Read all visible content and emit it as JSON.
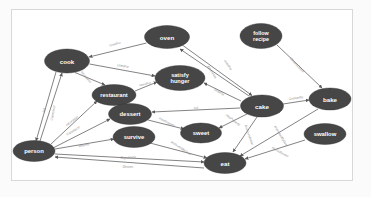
{
  "figure": {
    "kind": "knowledge-graph",
    "title": "",
    "background_color": "#ffffff",
    "border_color": "#d8d8d8",
    "node_fill": "#464646",
    "node_text_color": "#ffffff",
    "edge_color": "#5a5a5a",
    "edge_label_color": "#8a8a8a"
  },
  "nodes": [
    {
      "id": "oven",
      "label": "oven",
      "cx": 167,
      "cy": 37,
      "rx": 22.5,
      "ry": 11.5,
      "font": 6.2,
      "lines": [
        "oven"
      ]
    },
    {
      "id": "follow_recipe",
      "label": "follow recipe",
      "cx": 261,
      "cy": 36,
      "rx": 21,
      "ry": 12.5,
      "font": 5.4,
      "lines": [
        "follow",
        "recipe"
      ]
    },
    {
      "id": "cook",
      "label": "cook",
      "cx": 67,
      "cy": 61,
      "rx": 22.5,
      "ry": 12,
      "font": 6.2,
      "lines": [
        "cook"
      ]
    },
    {
      "id": "satisfy_hunger",
      "label": "satisfy hunger",
      "cx": 180,
      "cy": 78,
      "rx": 25,
      "ry": 12.5,
      "font": 5.6,
      "lines": [
        "satisfy",
        "hunger"
      ]
    },
    {
      "id": "restaurant",
      "label": "restaurant",
      "cx": 114,
      "cy": 95,
      "rx": 22,
      "ry": 10.5,
      "font": 5.6,
      "lines": [
        "restaurant"
      ]
    },
    {
      "id": "cake",
      "label": "cake",
      "cx": 262,
      "cy": 106,
      "rx": 21.5,
      "ry": 11,
      "font": 6.2,
      "lines": [
        "cake"
      ]
    },
    {
      "id": "bake",
      "label": "bake",
      "cx": 330,
      "cy": 99,
      "rx": 21,
      "ry": 11,
      "font": 6.2,
      "lines": [
        "bake"
      ]
    },
    {
      "id": "dessert",
      "label": "dessert",
      "cx": 130,
      "cy": 114,
      "rx": 21.5,
      "ry": 10.5,
      "font": 5.9,
      "lines": [
        "dessert"
      ]
    },
    {
      "id": "sweet",
      "label": "sweet",
      "cx": 201,
      "cy": 133,
      "rx": 20.5,
      "ry": 10,
      "font": 5.9,
      "lines": [
        "sweet"
      ]
    },
    {
      "id": "swallow",
      "label": "swallow",
      "cx": 325,
      "cy": 134,
      "rx": 21,
      "ry": 10.5,
      "font": 5.9,
      "lines": [
        "swallow"
      ]
    },
    {
      "id": "survive",
      "label": "survive",
      "cx": 134,
      "cy": 137,
      "rx": 21,
      "ry": 10.5,
      "font": 5.9,
      "lines": [
        "survive"
      ]
    },
    {
      "id": "person",
      "label": "person",
      "cx": 34,
      "cy": 151,
      "rx": 21,
      "ry": 10.5,
      "font": 5.9,
      "lines": [
        "person"
      ]
    },
    {
      "id": "eat",
      "label": "eat",
      "cx": 225,
      "cy": 163,
      "rx": 21,
      "ry": 10.5,
      "font": 6.2,
      "lines": [
        "eat"
      ]
    }
  ],
  "edges": [
    {
      "id": "oven-cook",
      "source": "oven",
      "target": "cook",
      "label": "UsedFor",
      "lx": 115,
      "ly": 44,
      "angle": -14
    },
    {
      "id": "cook-satisfy",
      "source": "cook",
      "target": "satisfy_hunger",
      "label": "UsedFor",
      "lx": 123,
      "ly": 66,
      "angle": 10
    },
    {
      "id": "cook-restaurant",
      "source": "cook",
      "target": "restaurant",
      "label": "AtLocation",
      "lx": 86,
      "ly": 77,
      "angle": 50
    },
    {
      "id": "restaurant-satisfy",
      "source": "restaurant",
      "target": "satisfy_hunger",
      "label": "UsedFor",
      "lx": 145,
      "ly": 84,
      "angle": -12
    },
    {
      "id": "oven-cake",
      "source": "oven",
      "target": "cake",
      "label": "UsedFor",
      "lx": 228,
      "ly": 65,
      "angle": 55
    },
    {
      "id": "cake-oven",
      "source": "cake",
      "target": "oven",
      "label": "AtLocation",
      "lx": 212,
      "ly": 72,
      "angle": 58
    },
    {
      "id": "cake-satisfy",
      "source": "cake",
      "target": "satisfy_hunger",
      "label": "UsedFor",
      "lx": 219,
      "ly": 92,
      "angle": 32
    },
    {
      "id": "follow-bake",
      "source": "follow_recipe",
      "target": "bake",
      "label": "CausesDesire",
      "lx": 297,
      "ly": 65,
      "angle": 48
    },
    {
      "id": "cake-bake",
      "source": "cake",
      "target": "bake",
      "label": "CreatedBy",
      "lx": 296,
      "ly": 98,
      "angle": -8
    },
    {
      "id": "cake-dessert",
      "source": "cake",
      "target": "dessert",
      "label": "IsA",
      "lx": 196,
      "ly": 108,
      "angle": -2
    },
    {
      "id": "dessert-sweet",
      "source": "dessert",
      "target": "sweet",
      "label": "HasProperty",
      "lx": 167,
      "ly": 122,
      "angle": 26
    },
    {
      "id": "cake-sweet",
      "source": "cake",
      "target": "sweet",
      "label": "HasProperty",
      "lx": 233,
      "ly": 120,
      "angle": 38
    },
    {
      "id": "cake-eat",
      "source": "cake",
      "target": "eat",
      "label": "ReceivesAction",
      "lx": 249,
      "ly": 135,
      "angle": 70
    },
    {
      "id": "bake-eat",
      "source": "bake",
      "target": "eat",
      "label": "MotivatedByGoal",
      "lx": 281,
      "ly": 136,
      "angle": 59
    },
    {
      "id": "swallow-eat",
      "source": "swallow",
      "target": "eat",
      "label": "HasSubevent",
      "lx": 280,
      "ly": 152,
      "angle": 29
    },
    {
      "id": "person-cook",
      "source": "person",
      "target": "cook",
      "label": "IsA",
      "lx": 44,
      "ly": 110,
      "angle": -78
    },
    {
      "id": "cook-person",
      "source": "cook",
      "target": "person",
      "label": "CapableOf",
      "lx": 53,
      "ly": 113,
      "angle": -78
    },
    {
      "id": "person-restaurant",
      "source": "person",
      "target": "restaurant",
      "label": "AtLocation",
      "lx": 72,
      "ly": 121,
      "angle": -37
    },
    {
      "id": "person-dessert",
      "source": "person",
      "target": "dessert",
      "label": "CapableOf",
      "lx": 73,
      "ly": 131,
      "angle": -30
    },
    {
      "id": "person-survive",
      "source": "person",
      "target": "survive",
      "label": "Desires",
      "lx": 84,
      "ly": 145,
      "angle": -13
    },
    {
      "id": "survive-eat",
      "source": "survive",
      "target": "eat",
      "label": "MotivatedByGoal",
      "lx": 181,
      "ly": 148,
      "angle": 33
    },
    {
      "id": "person-eat-capableof",
      "source": "person",
      "target": "eat",
      "label": "CapableOf",
      "lx": 128,
      "ly": 158,
      "angle": 0
    },
    {
      "id": "person-eat-desires",
      "source": "person",
      "target": "eat",
      "label": "Desires",
      "lx": 128,
      "ly": 167,
      "angle": 0
    }
  ],
  "edge_geometry": [
    {
      "id": "oven-cook",
      "path": "M 146.5,43 L 89,57",
      "arrow_at": "end"
    },
    {
      "id": "cook-satisfy",
      "path": "M 89.5,64 L 155,76",
      "arrow_at": "end"
    },
    {
      "id": "cook-restaurant",
      "path": "M 75,72.5 L 105,85",
      "arrow_at": "end"
    },
    {
      "id": "restaurant-satisfy",
      "path": "M 135,91 L 157,82",
      "arrow_at": "end"
    },
    {
      "id": "oven-cake",
      "path": "M 183,45.5 L 252,95.5",
      "arrow_at": "end"
    },
    {
      "id": "cake-oven",
      "path": "M 249,96 L 180,49",
      "arrow_at": "end"
    },
    {
      "id": "cake-satisfy",
      "path": "M 241,101 L 204,83",
      "arrow_at": "end"
    },
    {
      "id": "follow-bake",
      "path": "M 277,45 L 322,88",
      "arrow_at": "end"
    },
    {
      "id": "cake-bake",
      "path": "M 283,104 L 309,100",
      "arrow_at": "end"
    },
    {
      "id": "cake-dessert",
      "path": "M 240,108 L 152,112",
      "arrow_at": "end"
    },
    {
      "id": "dessert-sweet",
      "path": "M 148,120 L 184,129",
      "arrow_at": "end"
    },
    {
      "id": "cake-sweet",
      "path": "M 247,114 L 219,128",
      "arrow_at": "end"
    },
    {
      "id": "cake-eat",
      "path": "M 257,117 L 233,152",
      "arrow_at": "end"
    },
    {
      "id": "bake-eat",
      "path": "M 318,109 L 240,156",
      "arrow_at": "end"
    },
    {
      "id": "swallow-eat",
      "path": "M 305,140 L 245,159",
      "arrow_at": "end"
    },
    {
      "id": "person-cook",
      "path": "M 40,141 L 62,73",
      "arrow_at": "end"
    },
    {
      "id": "cook-person",
      "path": "M 56,72 L 36,141",
      "arrow_at": "end"
    },
    {
      "id": "person-restaurant",
      "path": "M 51,144 L 97,101",
      "arrow_at": "end"
    },
    {
      "id": "person-dessert",
      "path": "M 53,148 L 110,119",
      "arrow_at": "end"
    },
    {
      "id": "person-survive",
      "path": "M 55,149 L 114,139",
      "arrow_at": "end"
    },
    {
      "id": "survive-eat",
      "path": "M 150,143 L 207,158",
      "arrow_at": "end"
    },
    {
      "id": "person-eat-capableof",
      "path": "M 55,154 L 204,162",
      "arrow_at": "end"
    },
    {
      "id": "person-eat-desires",
      "path": "M 204,168 L 55,157",
      "arrow_at": "end"
    }
  ]
}
